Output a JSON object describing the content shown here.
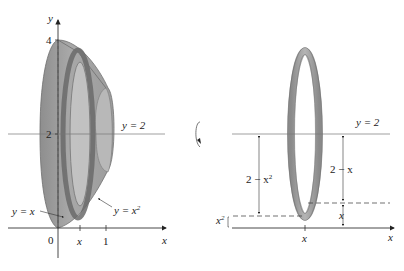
{
  "left_figure": {
    "axis_x_label": "x",
    "axis_y_label": "y",
    "y_ticks": [
      {
        "value": "4"
      },
      {
        "value": "2"
      }
    ],
    "x_ticks": [
      {
        "value": "0"
      },
      {
        "value": "x"
      },
      {
        "value": "1"
      }
    ],
    "line_label": "y = 2",
    "curve_labels": [
      {
        "text": "y = x"
      },
      {
        "text": "y = x",
        "sup": "2"
      }
    ]
  },
  "rotation_icon": "rotate-around-axis-icon",
  "right_figure": {
    "axis_x_label": "x",
    "x_tick": "x",
    "line_label": "y = 2",
    "outer_radius_label": {
      "text": "2 − x",
      "sup": "2"
    },
    "inner_radius_label": "2 − x",
    "small_gap_left": {
      "text": "x",
      "sup": "2"
    },
    "small_gap_right": "x"
  },
  "colors": {
    "solid_fill": "#9a9a9a",
    "solid_dark": "#7a7a7a",
    "solid_light": "#c4c4c4",
    "axis": "#333333"
  }
}
